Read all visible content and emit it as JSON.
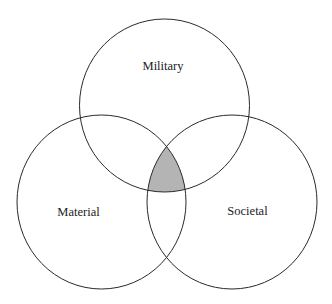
{
  "diagram": {
    "type": "venn",
    "background": "#ffffff",
    "stroke_color": "#2a2a2a",
    "highlight_color": "#b4b4b4",
    "highlighted_region": "intersection of Military, Material and Societal",
    "sets": [
      {
        "id": "military",
        "label": "Military",
        "cx": 164.5,
        "cy": 105.5,
        "rx": 85,
        "ry": 86.5,
        "label_x": 163,
        "label_y": 70
      },
      {
        "id": "material",
        "label": "Material",
        "cx": 101.5,
        "cy": 202,
        "rx": 84.5,
        "ry": 87,
        "label_x": 78.5,
        "label_y": 216
      },
      {
        "id": "societal",
        "label": "Societal",
        "cx": 232,
        "cy": 202,
        "rx": 85,
        "ry": 87,
        "label_x": 247.5,
        "label_y": 215
      }
    ]
  }
}
